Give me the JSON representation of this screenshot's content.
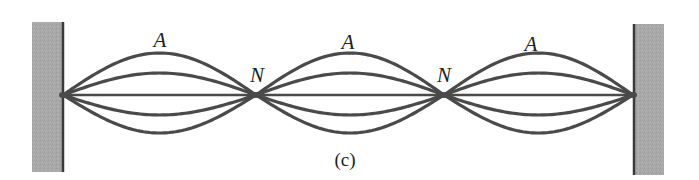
{
  "diagram": {
    "caption": "(c)",
    "colors": {
      "wall_fill": "#a8a8a8",
      "wall_edge": "#3a3a3a",
      "string": "#4a4a4a",
      "text": "#222222"
    },
    "walls": [
      {
        "name": "left-wall",
        "x": 32,
        "y": 22,
        "width": 31,
        "height": 150,
        "edge_x": 63
      },
      {
        "name": "right-wall",
        "x": 634,
        "y": 24,
        "width": 30,
        "height": 151,
        "edge_x": 634
      }
    ],
    "nodes": [
      {
        "label": "N",
        "x": 256,
        "y": 95,
        "label_x": 257,
        "label_y": 75
      },
      {
        "label": "N",
        "x": 444,
        "y": 95,
        "label_x": 444,
        "label_y": 75
      }
    ],
    "endpoints": {
      "left_x": 63,
      "right_x": 633,
      "y": 95
    },
    "antinodes": [
      {
        "label": "A",
        "x": 160,
        "label_y": 40
      },
      {
        "label": "A",
        "x": 348,
        "label_y": 42
      },
      {
        "label": "A",
        "x": 531,
        "label_y": 44
      }
    ],
    "amplitudes": [
      42,
      22,
      0,
      -20,
      -38
    ],
    "loop_count": 3
  }
}
